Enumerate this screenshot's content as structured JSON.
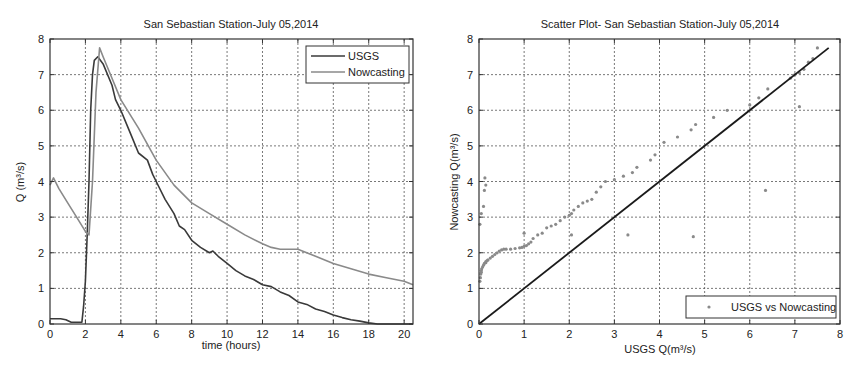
{
  "chart_data": [
    {
      "type": "line",
      "title": "San Sebastian Station-July 05,2014",
      "xlabel": "time (hours)",
      "ylabel": "Q (m³/s)",
      "xlim": [
        0,
        20.5
      ],
      "ylim": [
        0,
        8
      ],
      "xticks": [
        0,
        2,
        4,
        6,
        8,
        10,
        12,
        14,
        16,
        18,
        20
      ],
      "yticks": [
        0,
        1,
        2,
        3,
        4,
        5,
        6,
        7,
        8
      ],
      "grid": true,
      "legend_position": "upper right",
      "series": [
        {
          "name": "USGS",
          "color": "#3a3a3a",
          "x": [
            0,
            0.6,
            0.9,
            1.2,
            1.8,
            1.9,
            2.0,
            2.1,
            2.2,
            2.3,
            2.4,
            2.5,
            2.7,
            3.0,
            3.5,
            3.7,
            4.0,
            4.5,
            5.0,
            5.5,
            5.8,
            6.0,
            6.5,
            7.0,
            7.3,
            7.6,
            8.0,
            8.5,
            9.0,
            9.2,
            9.5,
            10.0,
            10.5,
            11.0,
            11.5,
            12.0,
            12.5,
            13.0,
            13.5,
            14.0,
            14.5,
            15.0,
            15.5,
            16.0,
            16.5,
            17.0,
            17.5,
            18.0,
            18.5,
            20.5
          ],
          "y": [
            0.15,
            0.15,
            0.12,
            0.05,
            0.05,
            0.5,
            1.2,
            2.5,
            4.0,
            6.0,
            7.0,
            7.4,
            7.5,
            7.3,
            6.7,
            6.3,
            6.0,
            5.4,
            4.8,
            4.6,
            4.2,
            4.0,
            3.5,
            3.1,
            2.75,
            2.65,
            2.35,
            2.15,
            2.0,
            2.05,
            1.9,
            1.7,
            1.5,
            1.35,
            1.25,
            1.1,
            1.05,
            0.9,
            0.8,
            0.62,
            0.55,
            0.42,
            0.35,
            0.25,
            0.18,
            0.12,
            0.08,
            0.03,
            0.0,
            0.0
          ]
        },
        {
          "name": "Nowcasting",
          "color": "#8a8a8a",
          "x": [
            0,
            0.2,
            0.5,
            1.0,
            1.5,
            2.0,
            2.2,
            2.4,
            2.6,
            2.8,
            3.0,
            3.5,
            4.0,
            5.0,
            6.0,
            7.0,
            8.0,
            9.0,
            10.0,
            11.0,
            12.0,
            12.5,
            13.0,
            14.0,
            15.0,
            16.0,
            17.0,
            18.0,
            19.0,
            20.0,
            20.5
          ],
          "y": [
            3.9,
            4.1,
            3.8,
            3.4,
            3.0,
            2.6,
            2.5,
            4.0,
            6.5,
            7.75,
            7.5,
            6.9,
            6.3,
            5.5,
            4.6,
            3.9,
            3.4,
            3.1,
            2.8,
            2.5,
            2.25,
            2.15,
            2.1,
            2.1,
            1.9,
            1.7,
            1.55,
            1.4,
            1.3,
            1.2,
            1.1
          ]
        }
      ]
    },
    {
      "type": "scatter",
      "title": "Scatter Plot- San Sebastian Station-July 05,2014",
      "xlabel": "USGS Q(m³/s)",
      "ylabel": "Nowcasting Q(m³/s)",
      "xlim": [
        0,
        8
      ],
      "ylim": [
        0,
        8
      ],
      "xticks": [
        0,
        1,
        2,
        3,
        4,
        5,
        6,
        7,
        8
      ],
      "yticks": [
        0,
        1,
        2,
        3,
        4,
        5,
        6,
        7,
        8
      ],
      "grid": true,
      "legend_position": "lower right",
      "reference_line": {
        "x": [
          0,
          7.75
        ],
        "y": [
          0,
          7.75
        ],
        "color": "#1a1a1a"
      },
      "series": [
        {
          "name": "USGS vs Nowcasting",
          "color": "#8a8a8a",
          "x": [
            0.02,
            0.03,
            0.04,
            0.05,
            0.05,
            0.06,
            0.08,
            0.1,
            0.12,
            0.15,
            0.15,
            0.18,
            0.2,
            0.25,
            0.3,
            0.35,
            0.4,
            0.45,
            0.5,
            0.55,
            0.6,
            0.7,
            0.8,
            0.9,
            0.95,
            1.0,
            1.05,
            1.1,
            1.15,
            1.2,
            1.3,
            1.4,
            1.5,
            1.6,
            1.7,
            1.8,
            1.9,
            2.0,
            2.05,
            2.1,
            2.2,
            2.3,
            2.4,
            2.5,
            2.6,
            2.7,
            2.8,
            0.05,
            0.1,
            0.12,
            0.15,
            0.13,
            0.02,
            1.0,
            2.05,
            3.3,
            4.75,
            6.35,
            3.0,
            3.2,
            3.4,
            3.5,
            3.8,
            3.9,
            4.1,
            4.4,
            4.7,
            4.8,
            5.2,
            5.5,
            6.0,
            6.2,
            6.4,
            6.9,
            7.0,
            7.1,
            7.2,
            7.3,
            7.4,
            7.5,
            7.1
          ],
          "y": [
            1.2,
            1.3,
            1.4,
            1.45,
            1.5,
            1.55,
            1.6,
            1.65,
            1.7,
            1.72,
            1.75,
            1.78,
            1.8,
            1.85,
            1.9,
            1.95,
            2.0,
            2.05,
            2.08,
            2.1,
            2.1,
            2.1,
            2.12,
            2.14,
            2.15,
            2.18,
            2.2,
            2.25,
            2.3,
            2.4,
            2.5,
            2.55,
            2.7,
            2.75,
            2.8,
            2.9,
            3.0,
            3.05,
            3.1,
            3.2,
            3.3,
            3.4,
            3.45,
            3.5,
            3.7,
            3.85,
            4.0,
            3.1,
            3.3,
            3.75,
            3.9,
            4.1,
            2.8,
            2.55,
            2.5,
            2.5,
            2.45,
            3.75,
            4.05,
            4.15,
            4.25,
            4.4,
            4.6,
            4.75,
            5.1,
            5.25,
            5.45,
            5.6,
            5.8,
            6.0,
            6.15,
            6.35,
            6.6,
            6.9,
            7.0,
            7.05,
            7.15,
            7.35,
            7.45,
            7.75,
            6.1
          ]
        }
      ]
    }
  ],
  "layout": {
    "left_plot": {
      "x0": 50,
      "y0": 39,
      "x1": 413,
      "y1": 324
    },
    "right_plot": {
      "x0": 479,
      "y0": 39,
      "x1": 840,
      "y1": 324
    }
  }
}
